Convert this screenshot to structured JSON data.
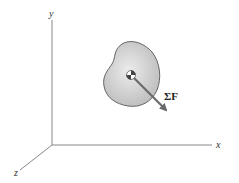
{
  "diagram": {
    "axes": {
      "x_label": "x",
      "y_label": "y",
      "z_label": "z"
    },
    "body": {
      "fill_color": "#c8c8c8",
      "stroke_color": "#555555"
    },
    "force": {
      "label": "ΣF",
      "arrow_color": "#6a6a6a"
    },
    "center_of_mass_marker": "center-of-mass-symbol"
  }
}
